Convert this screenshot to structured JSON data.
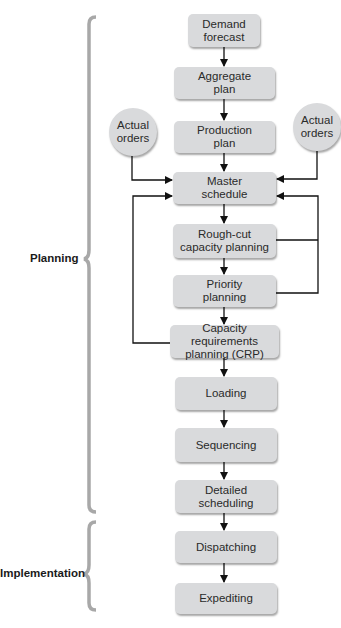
{
  "diagram": {
    "phases": [
      {
        "label": "Planning"
      },
      {
        "label": "Implementation"
      }
    ],
    "nodes": [
      {
        "id": "demand-forecast",
        "label": "Demand\nforecast"
      },
      {
        "id": "aggregate-plan",
        "label": "Aggregate\nplan"
      },
      {
        "id": "production-plan",
        "label": "Production\nplan"
      },
      {
        "id": "master-schedule",
        "label": "Master\nschedule"
      },
      {
        "id": "rough-cut",
        "label": "Rough-cut\ncapacity planning"
      },
      {
        "id": "priority-planning",
        "label": "Priority\nplanning"
      },
      {
        "id": "crp",
        "label": "Capacity requirements\nplanning (CRP)"
      },
      {
        "id": "loading",
        "label": "Loading"
      },
      {
        "id": "sequencing",
        "label": "Sequencing"
      },
      {
        "id": "detailed-scheduling",
        "label": "Detailed\nscheduling"
      },
      {
        "id": "dispatching",
        "label": "Dispatching"
      },
      {
        "id": "expediting",
        "label": "Expediting"
      }
    ],
    "inputs": [
      {
        "id": "actual-orders-left",
        "label": "Actual\norders"
      },
      {
        "id": "actual-orders-right",
        "label": "Actual\norders"
      }
    ]
  }
}
